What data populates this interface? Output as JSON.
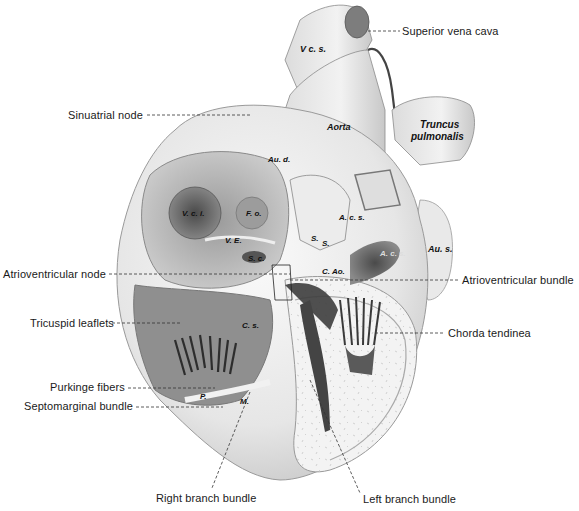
{
  "figure": {
    "callouts": [
      {
        "id": "superior-vena-cava",
        "label": "Superior vena cava",
        "x": 402,
        "y": 25
      },
      {
        "id": "sinuatrial-node",
        "label": "Sinuatrial node",
        "x": 68,
        "y": 109
      },
      {
        "id": "atrioventricular-node",
        "label": "Atrioventricular node",
        "x": 3,
        "y": 268
      },
      {
        "id": "atrioventricular-bundle",
        "label": "Atrioventricular bundle",
        "x": 462,
        "y": 276
      },
      {
        "id": "tricuspid-leaflets",
        "label": "Tricuspid leaflets",
        "x": 30,
        "y": 318
      },
      {
        "id": "chorda-tendinea",
        "label": "Chorda tendinea",
        "x": 448,
        "y": 328
      },
      {
        "id": "purkinge-fibers",
        "label": "Purkinge fibers",
        "x": 50,
        "y": 381
      },
      {
        "id": "septomarginal-bundle",
        "label": "Septomarginal bundle",
        "x": 24,
        "y": 400
      },
      {
        "id": "right-branch-bundle",
        "label": "Right branch bundle",
        "x": 156,
        "y": 492
      },
      {
        "id": "left-branch-bundle",
        "label": "Left branch bundle",
        "x": 363,
        "y": 493
      }
    ],
    "anatomical_labels": [
      {
        "id": "vcs",
        "label": "V c. s.",
        "x": 300,
        "y": 44,
        "size": "mid"
      },
      {
        "id": "aorta",
        "label": "Aorta",
        "x": 327,
        "y": 122,
        "size": "mid"
      },
      {
        "id": "truncus",
        "label": "Truncus",
        "x": 420,
        "y": 120,
        "size": "big"
      },
      {
        "id": "pulmonalis",
        "label": "pulmonalis",
        "x": 411,
        "y": 131,
        "size": "big"
      },
      {
        "id": "aud",
        "label": "Au. d.",
        "x": 268,
        "y": 155,
        "size": "small"
      },
      {
        "id": "vci",
        "label": "V. c. i.",
        "x": 182,
        "y": 209,
        "size": "small"
      },
      {
        "id": "fo",
        "label": "F. o.",
        "x": 248,
        "y": 209,
        "size": "small"
      },
      {
        "id": "acs",
        "label": "A. c. s.",
        "x": 339,
        "y": 213,
        "size": "small"
      },
      {
        "id": "ve",
        "label": "V. E.",
        "x": 225,
        "y": 236,
        "size": "small"
      },
      {
        "id": "s1",
        "label": "S.",
        "x": 311,
        "y": 235,
        "size": "small"
      },
      {
        "id": "s2",
        "label": "S.",
        "x": 322,
        "y": 239,
        "size": "small"
      },
      {
        "id": "aus",
        "label": "Au. s.",
        "x": 428,
        "y": 245,
        "size": "mid"
      },
      {
        "id": "sc",
        "label": "S. c.",
        "x": 250,
        "y": 255,
        "size": "small"
      },
      {
        "id": "acs2",
        "label": "A. c. s.",
        "x": 382,
        "y": 250,
        "size": "small"
      },
      {
        "id": "cao",
        "label": "C. Ao.",
        "x": 322,
        "y": 268,
        "size": "small"
      },
      {
        "id": "cs",
        "label": "C. s.",
        "x": 242,
        "y": 322,
        "size": "small"
      },
      {
        "id": "p",
        "label": "P.",
        "x": 200,
        "y": 392,
        "size": "small"
      },
      {
        "id": "m",
        "label": "M.",
        "x": 240,
        "y": 397,
        "size": "small"
      }
    ]
  }
}
